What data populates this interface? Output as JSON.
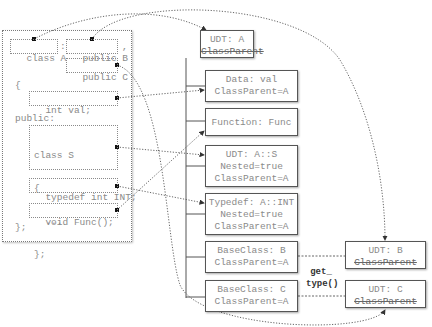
{
  "code_panel": {
    "class_decl": "class A",
    "colon": ":",
    "base_b": "public B",
    "comma": ",",
    "base_c": "public C",
    "open_brace": "{",
    "member_val": "int val;",
    "access_public": "public:",
    "nested_class": [
      "class S",
      "{",
      "  ...",
      "};"
    ],
    "typedef_decl": "typedef int INT;",
    "func_decl": "void Func();",
    "close_brace": "};"
  },
  "tree": {
    "root": {
      "title": "UDT: A",
      "struck": "ClassParent"
    },
    "children": [
      {
        "lines": [
          "Data: val",
          "ClassParent=A"
        ]
      },
      {
        "lines": [
          "Function: Func"
        ]
      },
      {
        "lines": [
          "UDT: A::S",
          "Nested=true",
          "ClassParent=A"
        ]
      },
      {
        "lines": [
          "Typedef: A::INT",
          "Nested=true",
          "ClassParent=A"
        ]
      },
      {
        "lines": [
          "BaseClass: B",
          "ClassParent=A"
        ]
      },
      {
        "lines": [
          "BaseClass: C",
          "ClassParent=A"
        ]
      }
    ]
  },
  "base_types": [
    {
      "title": "UDT: B",
      "struck": "ClassParent"
    },
    {
      "title": "UDT: C",
      "struck": "ClassParent"
    }
  ],
  "connector_label": [
    "get_",
    "type()"
  ],
  "colors": {
    "text": "#8a8a8a",
    "border": "#555555",
    "arrow": "#444444"
  }
}
